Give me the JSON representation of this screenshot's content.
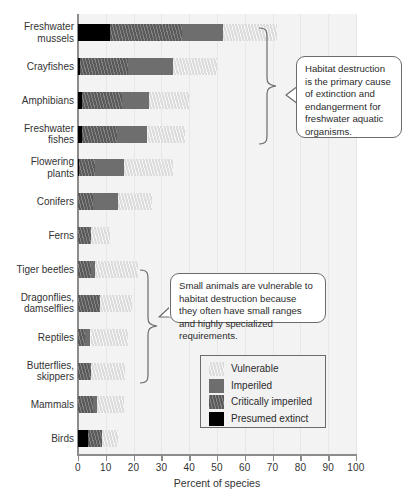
{
  "chart_data": {
    "type": "bar",
    "orientation": "horizontal",
    "stacked": true,
    "title": "",
    "xlabel": "Percent of species",
    "ylabel": "",
    "xlim": [
      0,
      100
    ],
    "xticks": [
      0,
      10,
      20,
      30,
      40,
      50,
      60,
      70,
      80,
      90,
      100
    ],
    "grid": "vertical",
    "legend_position": "inside-lower-right",
    "categories": [
      "Freshwater mussels",
      "Crayfishes",
      "Amphibians",
      "Freshwater fishes",
      "Flowering plants",
      "Conifers",
      "Ferns",
      "Tiger beetles",
      "Dragonflies, damselflies",
      "Reptiles",
      "Butterflies, skippers",
      "Mammals",
      "Birds"
    ],
    "series": [
      {
        "name": "Presumed extinct",
        "color": "#000000",
        "values": [
          11.5,
          0.8,
          1.5,
          1.5,
          0.4,
          0.0,
          0.0,
          0.0,
          0.0,
          0.0,
          0.0,
          0.0,
          3.5
        ]
      },
      {
        "name": "Critically imperiled",
        "color": "#5a5a5a",
        "values": [
          26.0,
          17.2,
          14.5,
          12.5,
          5.6,
          5.5,
          4.5,
          4.5,
          8.0,
          2.5,
          4.5,
          5.5,
          5.0
        ]
      },
      {
        "name": "Imperiled",
        "color": "#6e6e6e",
        "values": [
          14.5,
          16.0,
          9.5,
          11.0,
          10.5,
          9.0,
          0.0,
          1.5,
          0.0,
          2.0,
          0.0,
          1.5,
          0.0
        ]
      },
      {
        "name": "Vulnerable",
        "color": "#dcdcdc",
        "values": [
          19.5,
          16.0,
          14.5,
          13.5,
          17.5,
          12.0,
          7.0,
          15.5,
          11.5,
          13.5,
          12.5,
          9.5,
          6.0
        ]
      }
    ],
    "totals": [
      71.5,
      50.0,
      40.0,
      38.5,
      34.0,
      26.5,
      11.5,
      20.0,
      19.5,
      18.0,
      17.0,
      16.5,
      14.5
    ],
    "annotations": [
      {
        "id": "callout-1",
        "text": "Habitat destruction is the primary cause of extinction and endangerment for freshwater aquatic organisms.",
        "targets": [
          "Freshwater mussels",
          "Crayfishes",
          "Amphibians",
          "Freshwater fishes"
        ]
      },
      {
        "id": "callout-2",
        "text": "Small animals are vulnerable to habitat destruction because they often have small ranges and highly specialized requirements.",
        "targets": [
          "Tiger beetles",
          "Dragonflies, damselflies",
          "Reptiles",
          "Butterflies, skippers"
        ]
      }
    ]
  },
  "axis": {
    "x_label": "Percent of species",
    "ticks": [
      "0",
      "10",
      "20",
      "30",
      "40",
      "50",
      "60",
      "70",
      "80",
      "90",
      "100"
    ]
  },
  "categories": [
    {
      "line1": "Freshwater",
      "line2": "mussels"
    },
    {
      "line1": "Crayfishes",
      "line2": ""
    },
    {
      "line1": "Amphibians",
      "line2": ""
    },
    {
      "line1": "Freshwater",
      "line2": "fishes"
    },
    {
      "line1": "Flowering",
      "line2": "plants"
    },
    {
      "line1": "Conifers",
      "line2": ""
    },
    {
      "line1": "Ferns",
      "line2": ""
    },
    {
      "line1": "Tiger beetles",
      "line2": ""
    },
    {
      "line1": "Dragonflies,",
      "line2": "damselflies"
    },
    {
      "line1": "Reptiles",
      "line2": ""
    },
    {
      "line1": "Butterflies,",
      "line2": "skippers"
    },
    {
      "line1": "Mammals",
      "line2": ""
    },
    {
      "line1": "Birds",
      "line2": ""
    }
  ],
  "legend": {
    "items": [
      {
        "label": "Vulnerable",
        "color": "#dcdcdc"
      },
      {
        "label": "Imperiled",
        "color": "#6e6e6e"
      },
      {
        "label": "Critically imperiled",
        "color": "#5a5a5a"
      },
      {
        "label": "Presumed extinct",
        "color": "#000000"
      }
    ]
  },
  "callouts": {
    "top": "Habitat destruction is the primary cause of extinction and endangerment for freshwater aquatic organisms.",
    "bottom": "Small animals are vulnerable to habitat destruction because they often have small ranges and highly specialized requirements."
  },
  "colors": {
    "plot_background": "#f3f3f3",
    "gridline": "#e7e7e7",
    "axis": "#8c8c8c",
    "text": "#333333",
    "callout_border": "#6b6b6b"
  }
}
